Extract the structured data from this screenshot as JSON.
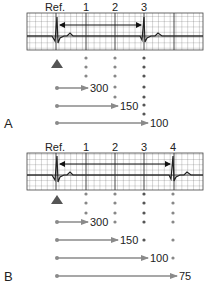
{
  "panels": [
    {
      "id": "A",
      "label": "A",
      "header_labels": [
        "Ref.",
        "1",
        "2",
        "3"
      ],
      "rr_interval_from": "Ref.",
      "rr_interval_to": "3",
      "dot_columns": [
        {
          "column": "1",
          "dots": 3
        },
        {
          "column": "2",
          "dots": 5
        },
        {
          "column": "3",
          "dots": 7
        }
      ],
      "arrows": [
        {
          "to_column": "1",
          "value": "300"
        },
        {
          "to_column": "2",
          "value": "150"
        },
        {
          "to_column": "3",
          "value": "100"
        }
      ]
    },
    {
      "id": "B",
      "label": "B",
      "header_labels": [
        "Ref.",
        "1",
        "2",
        "3",
        "4"
      ],
      "rr_interval_from": "Ref.",
      "rr_interval_to": "4",
      "dot_columns": [
        {
          "column": "1",
          "dots": 3
        },
        {
          "column": "2",
          "dots": 4
        },
        {
          "column": "3",
          "dots": 5
        },
        {
          "column": "4",
          "dots": 6
        }
      ],
      "arrows": [
        {
          "to_column": "1",
          "value": "300"
        },
        {
          "to_column": "2",
          "value": "150"
        },
        {
          "to_column": "3",
          "value": "100"
        },
        {
          "to_column": "4",
          "value": "75"
        }
      ]
    }
  ],
  "colors": {
    "grid_line": "#555555",
    "ecg_trace": "#333333",
    "interval_arrow": "#111111",
    "dot": "#888888",
    "dark_dot": "#555555",
    "scale_arrow": "#8a8a8a",
    "triangle": "#555555",
    "text": "#222222"
  }
}
